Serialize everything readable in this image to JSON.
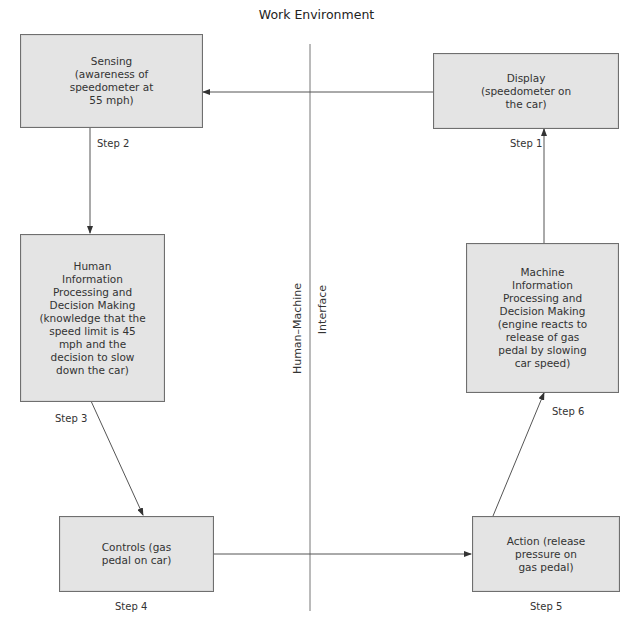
{
  "title": "Work Environment",
  "interface_label": {
    "left": "Human–Machine",
    "right": "Interface"
  },
  "boxes": {
    "sensing": "Sensing\n(awareness of\nspeedometer at\n55 mph)",
    "display": "Display\n(speedometer on\nthe car)",
    "human": "Human\nInformation\nProcessing and\nDecision Making\n(knowledge that the\nspeed limit is 45\nmph and the\ndecision to slow\ndown the car)",
    "machine": "Machine\nInformation\nProcessing and\nDecision Making\n(engine reacts to\nrelease of gas\npedal by slowing\ncar speed)",
    "controls": "Controls (gas\npedal on car)",
    "action": "Action (release\npressure on\ngas pedal)"
  },
  "steps": {
    "step1": "Step 1",
    "step2": "Step 2",
    "step3": "Step 3",
    "step4": "Step 4",
    "step5": "Step 5",
    "step6": "Step 6"
  },
  "colors": {
    "box_fill": "#e4e4e4",
    "box_border": "#6f6f6f",
    "line": "#555555"
  }
}
